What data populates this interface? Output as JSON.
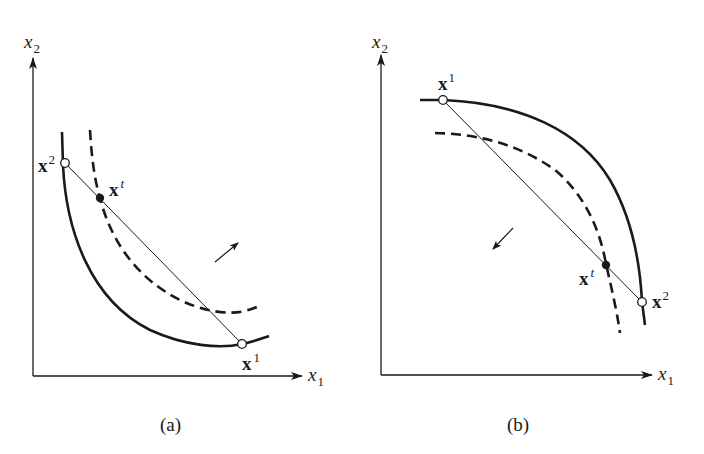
{
  "figure": {
    "panels": [
      {
        "id": "a",
        "caption": "(a)",
        "axes": {
          "x_label": "x",
          "x_sub": "1",
          "y_label": "x",
          "y_sub": "2"
        },
        "points": {
          "x2": {
            "label": "x",
            "sup": "2",
            "marker": "open-circle"
          },
          "xt": {
            "label": "x",
            "sup": "t",
            "marker": "filled-circle"
          },
          "x1": {
            "label": "x",
            "sup": "1",
            "marker": "open-circle"
          }
        },
        "curves": [
          {
            "name": "solid-curve",
            "style": "solid"
          },
          {
            "name": "dashed-curve",
            "style": "dashed"
          },
          {
            "name": "chord",
            "style": "thin"
          }
        ],
        "arrow_direction": "up-right"
      },
      {
        "id": "b",
        "caption": "(b)",
        "axes": {
          "x_label": "x",
          "x_sub": "1",
          "y_label": "x",
          "y_sub": "2"
        },
        "points": {
          "x1": {
            "label": "x",
            "sup": "1",
            "marker": "open-circle"
          },
          "xt": {
            "label": "x",
            "sup": "t",
            "marker": "filled-circle"
          },
          "x2": {
            "label": "x",
            "sup": "2",
            "marker": "open-circle"
          }
        },
        "curves": [
          {
            "name": "solid-curve",
            "style": "solid"
          },
          {
            "name": "dashed-curve",
            "style": "dashed"
          },
          {
            "name": "chord",
            "style": "thin"
          }
        ],
        "arrow_direction": "down-left"
      }
    ],
    "colors": {
      "ink": "#1a1a1a",
      "background": "#ffffff"
    }
  }
}
